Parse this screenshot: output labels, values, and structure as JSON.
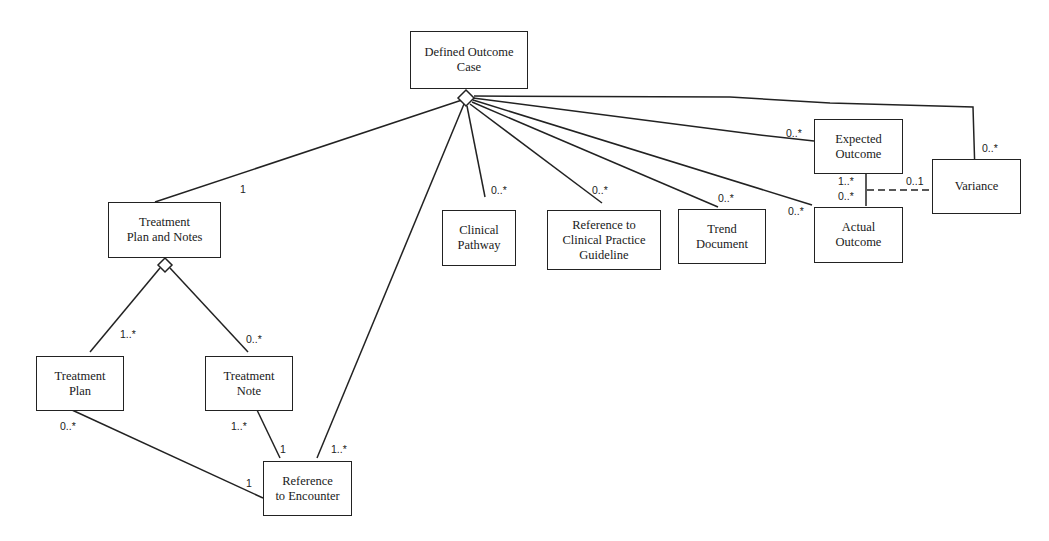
{
  "diagram": {
    "type": "UML class diagram",
    "classes": {
      "defined_outcome_case": "Defined Outcome\nCase",
      "treatment_plan_and_notes": "Treatment\nPlan and Notes",
      "clinical_pathway": "Clinical\nPathway",
      "reference_cpg": "Reference to\nClinical Practice\nGuideline",
      "trend_document": "Trend\nDocument",
      "expected_outcome": "Expected\nOutcome",
      "actual_outcome": "Actual\nOutcome",
      "variance": "Variance",
      "treatment_plan": "Treatment\nPlan",
      "treatment_note": "Treatment\nNote",
      "reference_to_encounter": "Reference\nto Encounter"
    },
    "multiplicities": {
      "doc_to_tpn": "1",
      "doc_to_clinical_pathway": "0..*",
      "doc_to_reference_cpg": "0..*",
      "doc_to_trend_document": "0..*",
      "doc_to_actual_outcome": "0..*",
      "doc_to_expected_outcome": "0..*",
      "doc_to_variance": "0..*",
      "expected_to_actual_top": "1..*",
      "expected_to_actual_bottom": "0..*",
      "variance_link": "0..1",
      "tpn_to_treatment_plan": "1..*",
      "tpn_to_treatment_note": "0..*",
      "treatment_plan_to_encounter": "0..*",
      "encounter_from_plan": "1",
      "treatment_note_to_encounter": "1..*",
      "encounter_from_note": "1",
      "doc_to_encounter": "1..*"
    }
  }
}
